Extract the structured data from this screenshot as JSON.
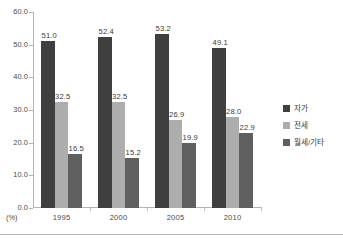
{
  "chart_data": {
    "type": "bar",
    "title": "",
    "subtitle": "",
    "xlabel": "",
    "ylabel": "",
    "unit_label": "(%)",
    "categories": [
      "1995",
      "2000",
      "2005",
      "2010"
    ],
    "series": [
      {
        "name": "자가",
        "color": "#3f3f3f",
        "values": [
          51.0,
          52.4,
          53.2,
          49.1
        ],
        "labels": [
          "51.0",
          "52.4",
          "53.2",
          "49.1"
        ]
      },
      {
        "name": "전세",
        "color": "#adadad",
        "values": [
          32.5,
          32.5,
          26.9,
          28.0
        ],
        "labels": [
          "32.5",
          "32.5",
          "26.9",
          "28.0"
        ]
      },
      {
        "name": "월세/기타",
        "color": "#5f5f5f",
        "values": [
          16.5,
          15.2,
          19.9,
          22.9
        ],
        "labels": [
          "16.5",
          "15.2",
          "19.9",
          "22.9"
        ]
      }
    ],
    "ylim": [
      0.0,
      60.0
    ],
    "ytick_values": [
      60.0,
      50.0,
      40.0,
      30.0,
      20.0,
      10.0,
      0.0
    ],
    "ytick_labels": [
      "60.0",
      "50.0",
      "40.0",
      "30.0",
      "20.0",
      "10.0",
      "0.0"
    ],
    "grid": false,
    "legend_position": "right",
    "axis_color": "#b4b4b4",
    "background": "#ffffff"
  }
}
